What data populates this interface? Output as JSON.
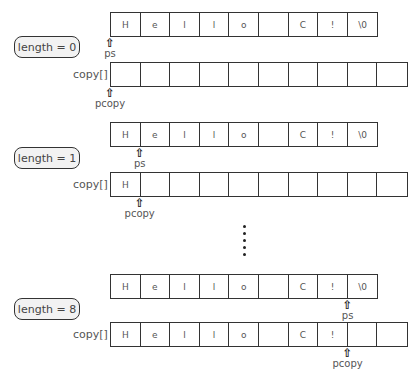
{
  "source": {
    "cells": [
      "H",
      "e",
      "l",
      "l",
      "o",
      " ",
      "C",
      "!",
      "\\0"
    ]
  },
  "copy_label": "copy[]",
  "pointer_labels": {
    "ps": "ps",
    "pcopy": "pcopy"
  },
  "arrow_glyph": "⇧",
  "blocks": [
    {
      "state": "length = 0",
      "copy_cells": [
        "",
        "",
        "",
        "",
        "",
        "",
        "",
        "",
        "",
        ""
      ],
      "ps_index": 0,
      "pcopy_index": 0
    },
    {
      "state": "length = 1",
      "copy_cells": [
        "H",
        "",
        "",
        "",
        "",
        "",
        "",
        "",
        "",
        ""
      ],
      "ps_index": 1,
      "pcopy_index": 1
    },
    {
      "state": "length = 8",
      "copy_cells": [
        "H",
        "e",
        "l",
        "l",
        "o",
        "",
        "C",
        "!",
        "",
        ""
      ],
      "ps_index": 8,
      "pcopy_index": 8
    }
  ],
  "ellipsis": "vertical dots"
}
